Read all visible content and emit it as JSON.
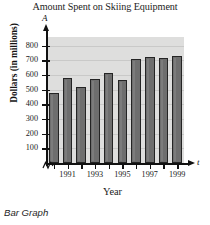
{
  "chart_data": {
    "type": "bar",
    "title": "Amount Spent on Skiing Equipment",
    "xlabel": "Year",
    "ylabel": "Dollars (in millions)",
    "x_axis_variable": "t",
    "y_axis_variable": "A",
    "categories": [
      "1990",
      "1991",
      "1992",
      "1993",
      "1994",
      "1995",
      "1996",
      "1997",
      "1998",
      "1999"
    ],
    "values": [
      475,
      578,
      522,
      572,
      612,
      567,
      710,
      725,
      718,
      732
    ],
    "x_tick_labels": [
      "",
      "1991",
      "",
      "1993",
      "",
      "1995",
      "",
      "1997",
      "",
      "1999"
    ],
    "y_ticks": [
      100,
      200,
      300,
      400,
      500,
      600,
      700,
      800
    ],
    "ylim": [
      0,
      860
    ],
    "grid": true,
    "legend": false,
    "axis_break": true,
    "bar_color": "#6e6e6e",
    "bar_edge_color": "#242424",
    "plot_background": "#dededd",
    "gridline_color": "#c9c9c8",
    "axis_color": "#111111"
  },
  "caption": "Bar Graph"
}
